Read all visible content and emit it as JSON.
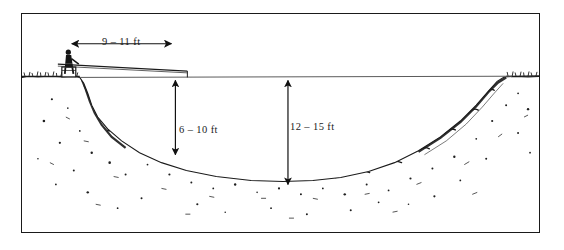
{
  "figure": {
    "kind": "pond-cross-section-diagram",
    "background_color": "#ffffff",
    "ink_color": "#1b1b1b",
    "border_color": "#1a1a1a"
  },
  "dimensions": [
    {
      "id": "span-width",
      "label": "9 – 11 ft",
      "orientation": "horizontal",
      "measures": "casting platform reach from near bank"
    },
    {
      "id": "depth-shallow",
      "label": "6 – 10 ft",
      "orientation": "vertical",
      "measures": "shallow water depth near the bank shelf"
    },
    {
      "id": "depth-deep",
      "label": "12 – 15 ft",
      "orientation": "vertical",
      "measures": "maximum water depth at pond center"
    }
  ],
  "scene": {
    "angler": "angler-figure",
    "seat": "seat-block",
    "rod": "fishing-rod-line",
    "water_surface": "water-surface-line",
    "left_bank": "left-bank-slope",
    "right_bank": "right-bank-slope",
    "pond_bottom": "pond-bottom-contour"
  }
}
